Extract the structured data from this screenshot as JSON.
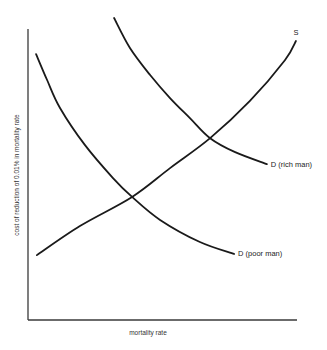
{
  "chart_data": {
    "type": "line",
    "title": "",
    "xlabel": "mortality rate",
    "ylabel": "cost of reduction of 0.01% in mortality rate",
    "xlim": [
      0,
      100
    ],
    "ylim": [
      0,
      110
    ],
    "grid": false,
    "legend": "none (curves labelled directly at line ends)",
    "series": [
      {
        "name": "S",
        "label": "S",
        "label_anchor": "end-top",
        "points": [
          [
            3.3,
            22.3
          ],
          [
            19.3,
            32.3
          ],
          [
            38.7,
            42.3
          ],
          [
            52.8,
            52.2
          ],
          [
            67.7,
            62.5
          ],
          [
            82.5,
            75.3
          ],
          [
            95.5,
            89.3
          ],
          [
            99.6,
            95.9
          ]
        ]
      },
      {
        "name": "D (poor man)",
        "label": "D (poor man)",
        "label_anchor": "end-right",
        "points": [
          [
            3.0,
            91.4
          ],
          [
            7.1,
            82.5
          ],
          [
            11.9,
            72.9
          ],
          [
            21.2,
            60.1
          ],
          [
            31.6,
            48.8
          ],
          [
            38.7,
            42.3
          ],
          [
            49.1,
            34.4
          ],
          [
            63.9,
            26.8
          ],
          [
            76.6,
            22.7
          ]
        ]
      },
      {
        "name": "D (rich man)",
        "label": "D (rich man)",
        "label_anchor": "end-right",
        "points": [
          [
            32.0,
            103.8
          ],
          [
            37.9,
            93.5
          ],
          [
            45.4,
            84.2
          ],
          [
            52.8,
            76.3
          ],
          [
            60.2,
            69.4
          ],
          [
            67.7,
            62.5
          ],
          [
            77.0,
            57.7
          ],
          [
            88.8,
            53.6
          ]
        ]
      }
    ],
    "intersections": [
      {
        "between": [
          "S",
          "D (poor man)"
        ],
        "x": 38.7,
        "y": 42.3
      },
      {
        "between": [
          "S",
          "D (rich man)"
        ],
        "x": 67.7,
        "y": 62.5
      }
    ]
  }
}
